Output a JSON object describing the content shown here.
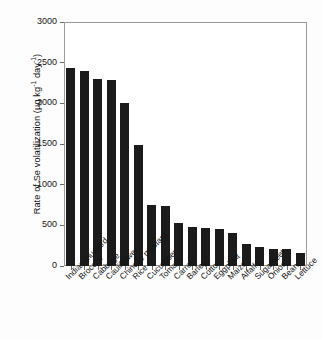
{
  "chart_data": {
    "type": "bar",
    "title": "",
    "xlabel": "",
    "ylabel": "Rate of Se volatilization (µg kg⁻¹ day⁻¹)",
    "ylabel_parts": {
      "prefix": "Rate of Se volatilization (µg kg",
      "sup1": "-1",
      "middle": " day",
      "sup2": "-1",
      "suffix": ")"
    },
    "ylim": [
      0,
      3000
    ],
    "yticks": [
      0,
      500,
      1000,
      1500,
      2000,
      2500,
      3000
    ],
    "ytick_labels": [
      "0",
      "500",
      "1000",
      "1500",
      "2000",
      "2500",
      "3000"
    ],
    "grid": false,
    "legend": null,
    "bar_color": "#1b1b1b",
    "axis_color": "#9a9a9a",
    "categories": [
      "Indian mustard",
      "Broccoli",
      "Cabbage",
      "Cauliflower",
      "Chinese mustard",
      "Rice",
      "Cucumber",
      "Tomato",
      "Carrot",
      "Barley",
      "Cotton",
      "Eggplant",
      "Maize",
      "Alfalfa",
      "Sugarbeet",
      "Onion",
      "Bean",
      "Lettuce"
    ],
    "values": [
      2430,
      2395,
      2305,
      2285,
      2010,
      1490,
      750,
      735,
      535,
      480,
      470,
      450,
      410,
      265,
      230,
      215,
      205,
      160
    ]
  }
}
